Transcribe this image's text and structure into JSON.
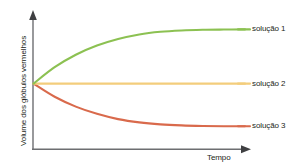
{
  "chart_data": {
    "type": "line",
    "title": "",
    "xlabel": "Tempo",
    "ylabel": "Volume dos glóbulos vermelhos",
    "grid": false,
    "legend_position": "right-inline-at-curve-end",
    "axis_style": "arrow-headed L axes, no tick labels",
    "xlim": [
      0,
      10
    ],
    "ylim": [
      0,
      10
    ],
    "x": [
      0,
      1,
      2,
      3,
      4,
      5,
      6,
      7,
      8,
      9,
      10
    ],
    "series": [
      {
        "name": "solução 1",
        "color": "#8cc152",
        "description": "volume aumenta e estabiliza (hipotónica / hemólise)",
        "values": [
          5.0,
          6.25,
          7.2,
          7.9,
          8.4,
          8.75,
          8.95,
          9.05,
          9.1,
          9.12,
          9.13
        ]
      },
      {
        "name": "solução 2",
        "color": "#f3cd7c",
        "description": "volume constante (isotónica)",
        "values": [
          5.0,
          5.0,
          5.0,
          5.0,
          5.0,
          5.0,
          5.0,
          5.0,
          5.0,
          5.0,
          5.0
        ]
      },
      {
        "name": "solução 3",
        "color": "#d96a4c",
        "description": "volume diminui e estabiliza (hipertónica / crenação)",
        "values": [
          5.0,
          4.0,
          3.25,
          2.7,
          2.3,
          2.05,
          1.9,
          1.82,
          1.78,
          1.76,
          1.75
        ]
      }
    ],
    "colors": {
      "series_1": "#8cc152",
      "series_2": "#f3cd7c",
      "series_3": "#d96a4c",
      "axis": "#58595b",
      "text": "#231f20",
      "background": "#ffffff"
    }
  },
  "axes": {
    "y_title": "Volume dos glóbulos vermelhos",
    "x_title": "Tempo"
  },
  "legend": {
    "items": [
      {
        "label": "solução 1",
        "color": "#8cc152"
      },
      {
        "label": "solução 2",
        "color": "#f3cd7c"
      },
      {
        "label": "solução 3",
        "color": "#d96a4c"
      }
    ]
  }
}
